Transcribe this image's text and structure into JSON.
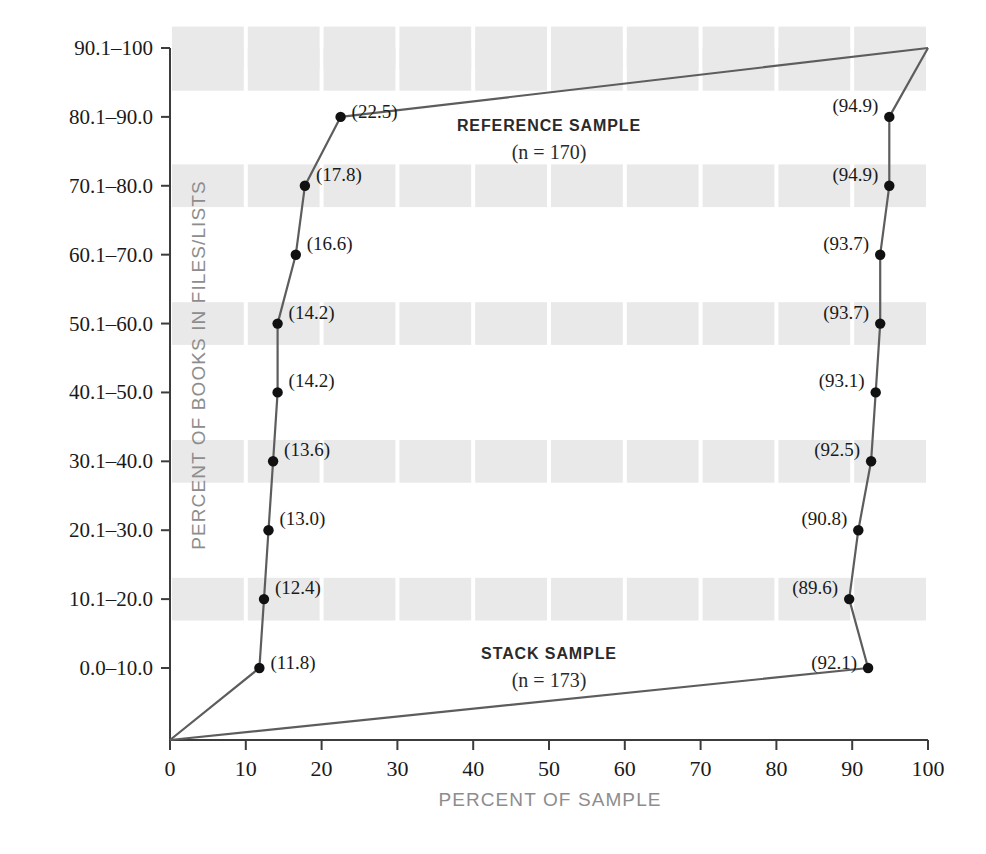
{
  "chart_data": {
    "type": "line",
    "title": "",
    "xlabel": "PERCENT OF SAMPLE",
    "ylabel": "PERCENT OF BOOKS IN FILES/LISTS",
    "xlim": [
      0,
      100
    ],
    "grid": "banded",
    "legend_position": "inline-annotation",
    "categories": [
      "0.0–10.0",
      "10.1–20.0",
      "20.1–30.0",
      "30.1–40.0",
      "40.1–50.0",
      "50.1–60.0",
      "60.1–70.0",
      "70.1–80.0",
      "80.1–90.0",
      "90.1–100"
    ],
    "xticks": [
      0,
      10,
      20,
      30,
      40,
      50,
      60,
      70,
      80,
      90,
      100
    ],
    "xtick_labels": [
      "0",
      "10",
      "20",
      "30",
      "40",
      "50",
      "60",
      "70",
      "80",
      "90",
      "100"
    ],
    "series": [
      {
        "name": "REFERENCE SAMPLE",
        "n_label": "(n = 170)",
        "n": 170,
        "values": [
          11.8,
          12.4,
          13.0,
          13.6,
          14.2,
          14.2,
          16.6,
          17.8,
          22.5,
          100.0
        ],
        "value_labels": [
          "(11.8)",
          "(12.4)",
          "(13.0)",
          "(13.6)",
          "(14.2)",
          "(14.2)",
          "(16.6)",
          "(17.8)",
          "(22.5)",
          ""
        ],
        "label_side": "right",
        "origin_anchor": true
      },
      {
        "name": "STACK SAMPLE",
        "n_label": "(n = 173)",
        "n": 173,
        "values": [
          92.1,
          89.6,
          90.8,
          92.5,
          93.1,
          93.7,
          93.7,
          94.9,
          94.9,
          100.0
        ],
        "value_labels": [
          "(92.1)",
          "(89.6)",
          "(90.8)",
          "(92.5)",
          "(93.1)",
          "(93.7)",
          "(93.7)",
          "(94.9)",
          "(94.9)",
          ""
        ],
        "label_side": "left",
        "origin_anchor": true
      }
    ],
    "annotations": [
      {
        "text": "REFERENCE SAMPLE",
        "sub": "(n = 170)",
        "x": 50,
        "y_px": 131
      },
      {
        "text": "STACK SAMPLE",
        "sub": "(n = 173)",
        "x": 50,
        "y_px": 659
      }
    ],
    "colors": {
      "line": "#5d5d5d",
      "marker": "#111111",
      "band": "#e9e9e9",
      "axis": "#3c3c3c",
      "axis_title": "#8d8d8d",
      "text": "#1a1a1a",
      "background": "#ffffff"
    }
  }
}
